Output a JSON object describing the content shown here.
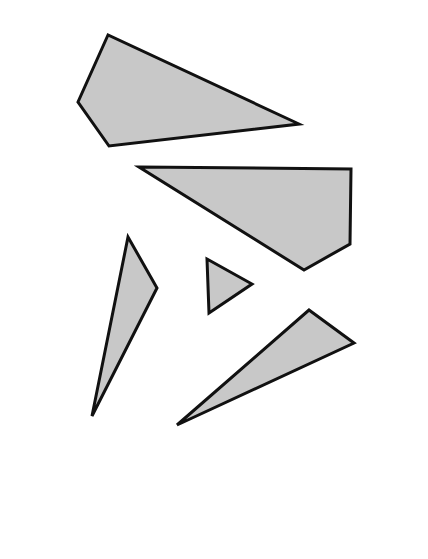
{
  "diagram": {
    "canvas": {
      "width": 428,
      "height": 559,
      "background": "#ffffff"
    },
    "style": {
      "fill": "#c8c8c8",
      "stroke": "#111111",
      "stroke_width": 3
    },
    "shapes": [
      {
        "id": "quad-top",
        "type": "quadrilateral",
        "points": "108,35 78,102 109,146 299,124"
      },
      {
        "id": "quad-middle",
        "type": "quadrilateral",
        "points": "139,167 351,169 350,244 304,270"
      },
      {
        "id": "triangle-tall",
        "type": "triangle",
        "points": "128,237 157,288 92,416"
      },
      {
        "id": "triangle-small",
        "type": "triangle",
        "points": "207,259 252,284 209,313"
      },
      {
        "id": "triangle-bottom",
        "type": "triangle",
        "points": "309,310 354,343 177,425"
      }
    ]
  }
}
